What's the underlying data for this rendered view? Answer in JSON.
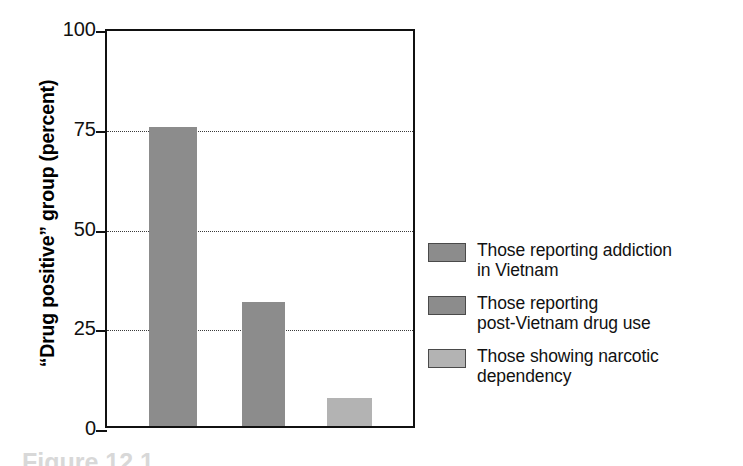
{
  "chart_data": {
    "type": "bar",
    "title": "",
    "xlabel": "",
    "ylabel": "“Drug positive” group (percent)",
    "ylim": [
      0,
      100
    ],
    "yticks": [
      0,
      25,
      50,
      75,
      100
    ],
    "ytick_labels": [
      "0",
      "25",
      "50",
      "75",
      "100"
    ],
    "grid": "horizontal-dotted",
    "legend_position": "right",
    "categories": [
      "Those reporting addiction in Vietnam",
      "Those reporting post-Vietnam drug use",
      "Those showing narcotic dependency"
    ],
    "values": [
      75,
      31,
      7
    ],
    "bar_colors": [
      "#8c8c8c",
      "#8c8c8c",
      "#b3b3b3"
    ]
  },
  "axis": {
    "y_title": "“Drug positive” group (percent)",
    "ticks": [
      {
        "label": "100",
        "value": 100
      },
      {
        "label": "75",
        "value": 75
      },
      {
        "label": "50",
        "value": 50
      },
      {
        "label": "25",
        "value": 25
      },
      {
        "label": "0",
        "value": 0
      }
    ]
  },
  "legend": {
    "items": [
      {
        "line1": "Those reporting addiction",
        "line2": "in Vietnam",
        "color": "#8c8c8c"
      },
      {
        "line1": "Those reporting",
        "line2": "post-Vietnam drug use",
        "color": "#8c8c8c"
      },
      {
        "line1": "Those showing narcotic",
        "line2": "dependency",
        "color": "#b3b3b3"
      }
    ]
  },
  "caption": {
    "text": "Figure 12.1"
  },
  "colors": {
    "bar_dark": "#8c8c8c",
    "bar_light": "#b3b3b3",
    "axis": "#111111",
    "grid": "#3a3a3a"
  }
}
